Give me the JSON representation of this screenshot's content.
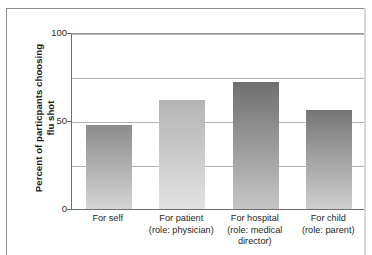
{
  "chart_data": {
    "type": "bar",
    "title": "",
    "subtitle": "",
    "xlabel": "",
    "ylabel": "Percent of particpants choosing flu shot",
    "ylim": [
      0,
      100
    ],
    "yticks": [
      0,
      50,
      100
    ],
    "ytick_labels": [
      "0",
      "50",
      "100"
    ],
    "gridlines": [
      25,
      50,
      75,
      100
    ],
    "grid": true,
    "legend": "none",
    "categories": [
      "For self",
      "For patient (role: physician)",
      "For hospital (role: medical director)",
      "For child (role: parent)"
    ],
    "category_lines": [
      [
        "For self"
      ],
      [
        "For patient",
        "(role: physician)"
      ],
      [
        "For hospital",
        "(role: medical",
        "director)"
      ],
      [
        "For child",
        "(role: parent)"
      ]
    ],
    "values": [
      48,
      62,
      72,
      56
    ],
    "bar_colors_top": [
      "#8c8c8c",
      "#b4b4b4",
      "#6f6f6f",
      "#767676"
    ],
    "bar_colors_bottom": [
      "#d5d5d5",
      "#e2e2e2",
      "#c6c6c6",
      "#cfcfcf"
    ]
  },
  "axis": {
    "y_title": "Percent of particpants choosing flu shot",
    "tick_100": "100",
    "tick_50": "50",
    "tick_0": "0"
  },
  "bars": [
    {
      "label": "For self",
      "line1": "For self",
      "line2": "",
      "line3": "",
      "value": 48,
      "value_text": "48"
    },
    {
      "label": "For patient (role: physician)",
      "line1": "For patient",
      "line2": "(role: physician)",
      "line3": "",
      "value": 62,
      "value_text": "62"
    },
    {
      "label": "For hospital (role: medical director)",
      "line1": "For hospital",
      "line2": "(role: medical",
      "line3": "director)",
      "value": 72,
      "value_text": "72"
    },
    {
      "label": "For child (role: parent)",
      "line1": "For child",
      "line2": "(role: parent)",
      "line3": "",
      "value": 56,
      "value_text": "56"
    }
  ],
  "colors": {
    "grid": "#b4b4b4",
    "axis": "#6e6e6e",
    "frame": "#8d8d8d",
    "text": "#1f1f1f",
    "background": "#ffffff"
  }
}
